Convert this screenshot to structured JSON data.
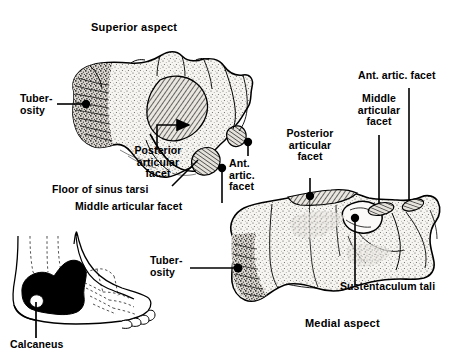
{
  "figure": {
    "title_superior": "Superior aspect",
    "title_medial": "Medial aspect",
    "subject": "calcaneus",
    "colors": {
      "ink": "#000000",
      "paper": "#ffffff",
      "bone_fill": "#f4f2ee",
      "stipple": "#3a3a3a",
      "hatch": "#111111",
      "silhouette": "#000000"
    }
  },
  "labels": {
    "superior_tuberosity": "Tuber-\nosity",
    "superior_posterior_articular_facet": "Posterior\narticular\nfacet",
    "superior_floor_of_sinus_tarsi": "Floor of sinus tarsi",
    "superior_middle_articular_facet": "Middle articular facet",
    "superior_ant_artic_facet": "Ant.\nartic.\nfacet",
    "medial_posterior_articular_facet": "Posterior\narticular\nfacet",
    "medial_middle_articular_facet": "Middle\narticular\nfacet",
    "medial_ant_artic_facet": "Ant. artic. facet",
    "medial_tuberosity": "Tuber-\nosity",
    "medial_sustentaculum_tali": "Sustentaculum tali",
    "inset_calcaneus": "Calcaneus"
  }
}
